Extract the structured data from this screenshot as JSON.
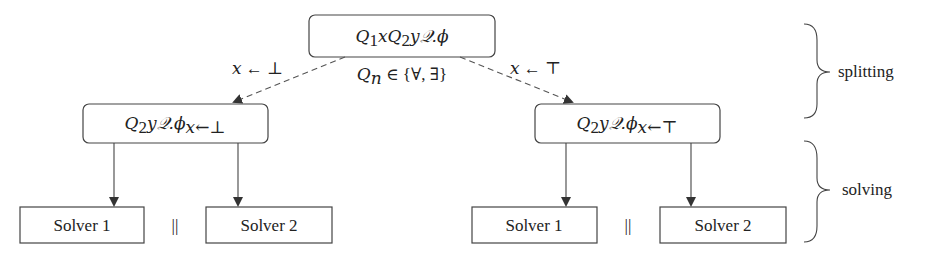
{
  "diagram": {
    "root": {
      "q1": "Q",
      "q1_sub": "1",
      "x": "x",
      "q2": "Q",
      "q2_sub": "2",
      "y": "y",
      "rest": "𝒬.ϕ"
    },
    "quantifier_note": {
      "q": "Q",
      "q_sub": "n",
      "text": " ∈ {∀, ∃}"
    },
    "edge_left_label": {
      "var": "x",
      "text": " ← ⊥"
    },
    "edge_right_label": {
      "var": "x",
      "text": " ← ⊤"
    },
    "left_branch": {
      "q": "Q",
      "q_sub": "2",
      "y": "y",
      "rest": "𝒬.ϕ",
      "subscript": "x←⊥"
    },
    "right_branch": {
      "q": "Q",
      "q_sub": "2",
      "y": "y",
      "rest": "𝒬.ϕ",
      "subscript": "x←⊤"
    },
    "solvers": {
      "left": [
        "Solver 1",
        "Solver 2"
      ],
      "right": [
        "Solver 1",
        "Solver 2"
      ],
      "parallel_symbol": "||"
    },
    "phases": {
      "splitting": "splitting",
      "solving": "solving"
    }
  }
}
